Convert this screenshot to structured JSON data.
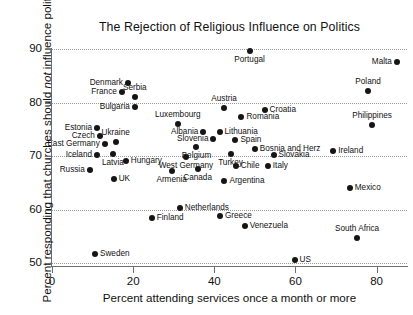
{
  "chart_data": {
    "type": "scatter",
    "title": "The Rejection of Religious Influence on Politics",
    "xlabel": "Percent attending services once a month or more",
    "ylabel_prefix": "Percent responding that churches should ",
    "ylabel_italic": "not",
    "ylabel_suffix": " influence politics",
    "xlim": [
      0,
      87.5
    ],
    "ylim": [
      50,
      90
    ],
    "xticks": [
      0,
      20,
      40,
      60,
      80
    ],
    "yticks": [
      50,
      60,
      70,
      80,
      90
    ],
    "grid": "horizontal-dotted",
    "legend": "none",
    "point_color": "#151515",
    "points": [
      {
        "label": "Portugal",
        "x": 48.7,
        "y": 89.6,
        "pos": "below"
      },
      {
        "label": "Malta",
        "x": 85.0,
        "y": 87.6,
        "pos": "left"
      },
      {
        "label": "Denmark",
        "x": 18.7,
        "y": 83.7,
        "pos": "left"
      },
      {
        "label": "Poland",
        "x": 77.9,
        "y": 82.1,
        "pos": "above"
      },
      {
        "label": "Serbia",
        "x": 20.4,
        "y": 81.1,
        "pos": "above"
      },
      {
        "label": "France",
        "x": 17.2,
        "y": 82.0,
        "pos": "left"
      },
      {
        "label": "Austria",
        "x": 42.4,
        "y": 79.0,
        "pos": "above"
      },
      {
        "label": "Bulgaria",
        "x": 20.4,
        "y": 79.1,
        "pos": "left"
      },
      {
        "label": "Croatia",
        "x": 52.4,
        "y": 78.6,
        "pos": "right"
      },
      {
        "label": "Romania",
        "x": 46.7,
        "y": 77.3,
        "pos": "right"
      },
      {
        "label": "Philippines",
        "x": 78.9,
        "y": 75.8,
        "pos": "above"
      },
      {
        "label": "Luxembourg",
        "x": 31.0,
        "y": 75.9,
        "pos": "above"
      },
      {
        "label": "Estonia",
        "x": 11.1,
        "y": 75.3,
        "pos": "left"
      },
      {
        "label": "Albania",
        "x": 37.3,
        "y": 74.4,
        "pos": "left"
      },
      {
        "label": "Lithuania",
        "x": 41.3,
        "y": 74.4,
        "pos": "right"
      },
      {
        "label": "Czech",
        "x": 11.8,
        "y": 73.8,
        "pos": "left"
      },
      {
        "label": "Slovenia",
        "x": 39.8,
        "y": 73.2,
        "pos": "left"
      },
      {
        "label": "Spain",
        "x": 45.2,
        "y": 73.0,
        "pos": "right"
      },
      {
        "label": "Ukraine",
        "x": 15.7,
        "y": 72.6,
        "pos": "above"
      },
      {
        "label": "East Germany",
        "x": 13.0,
        "y": 72.2,
        "pos": "left"
      },
      {
        "label": "Belgium",
        "x": 35.6,
        "y": 71.7,
        "pos": "below"
      },
      {
        "label": "Bosnia and Herz",
        "x": 50.0,
        "y": 71.3,
        "pos": "right"
      },
      {
        "label": "Ireland",
        "x": 69.3,
        "y": 71.0,
        "pos": "right"
      },
      {
        "label": "Latvia",
        "x": 15.0,
        "y": 70.4,
        "pos": "below"
      },
      {
        "label": "Iceland",
        "x": 11.1,
        "y": 70.1,
        "pos": "left"
      },
      {
        "label": "Slovakia",
        "x": 54.6,
        "y": 70.1,
        "pos": "right"
      },
      {
        "label": "West Germany",
        "x": 33.0,
        "y": 69.8,
        "pos": "below"
      },
      {
        "label": "Turkey",
        "x": 44.0,
        "y": 70.4,
        "pos": "below"
      },
      {
        "label": "Hungary",
        "x": 18.2,
        "y": 69.1,
        "pos": "right"
      },
      {
        "label": "Chile",
        "x": 45.3,
        "y": 68.2,
        "pos": "right"
      },
      {
        "label": "Italy",
        "x": 53.2,
        "y": 68.2,
        "pos": "right"
      },
      {
        "label": "Russia",
        "x": 9.3,
        "y": 67.4,
        "pos": "left"
      },
      {
        "label": "Canada",
        "x": 35.9,
        "y": 67.6,
        "pos": "below"
      },
      {
        "label": "Armenia",
        "x": 29.5,
        "y": 67.2,
        "pos": "below"
      },
      {
        "label": "UK",
        "x": 15.2,
        "y": 65.7,
        "pos": "right"
      },
      {
        "label": "Argentina",
        "x": 42.5,
        "y": 65.4,
        "pos": "right"
      },
      {
        "label": "Mexico",
        "x": 73.4,
        "y": 64.0,
        "pos": "right"
      },
      {
        "label": "Netherlands",
        "x": 31.5,
        "y": 60.2,
        "pos": "right"
      },
      {
        "label": "Greece",
        "x": 41.4,
        "y": 58.8,
        "pos": "right"
      },
      {
        "label": "Finland",
        "x": 24.6,
        "y": 58.5,
        "pos": "right"
      },
      {
        "label": "Venezuela",
        "x": 47.5,
        "y": 56.9,
        "pos": "right"
      },
      {
        "label": "South Africa",
        "x": 75.2,
        "y": 54.7,
        "pos": "above"
      },
      {
        "label": "Sweden",
        "x": 10.6,
        "y": 51.7,
        "pos": "right"
      },
      {
        "label": "US",
        "x": 59.8,
        "y": 50.5,
        "pos": "right"
      }
    ]
  }
}
